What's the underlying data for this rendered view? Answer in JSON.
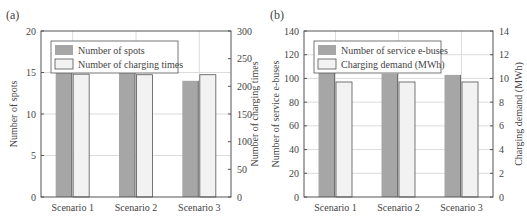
{
  "colors": {
    "bar_dark": "#a6a6a6",
    "bar_light": "#f2f2f2",
    "bar_stroke": "#555555",
    "grid": "#dcdcdc",
    "axis": "#555555"
  },
  "chart_data": [
    {
      "panel_label": "(a)",
      "type": "bar",
      "title": "",
      "categories": [
        "Scenario 1",
        "Scenario 2",
        "Scenario 3"
      ],
      "series": [
        {
          "name": "Number of spots",
          "axis": "left",
          "values": [
            15,
            15,
            14
          ]
        },
        {
          "name": "Number of charging times",
          "axis": "right",
          "values": [
            222,
            221,
            221
          ]
        }
      ],
      "xlabel": "",
      "ylabel": "Number of spots",
      "ylabel_right": "Number of charging times",
      "ylim": [
        0,
        20
      ],
      "ylim_right": [
        0,
        300
      ],
      "yticks": [
        0,
        5,
        10,
        15,
        20
      ],
      "yticks_right": [
        0,
        50,
        100,
        150,
        200,
        250,
        300
      ],
      "grid": true,
      "legend_position": "upper left"
    },
    {
      "panel_label": "(b)",
      "type": "bar",
      "title": "",
      "categories": [
        "Scenario 1",
        "Scenario 2",
        "Scenario 3"
      ],
      "series": [
        {
          "name": "Number of service e-buses",
          "axis": "left",
          "values": [
            106,
            104,
            103
          ]
        },
        {
          "name": "Charging demand (MWh)",
          "axis": "right",
          "values": [
            9.7,
            9.7,
            9.7
          ]
        }
      ],
      "xlabel": "",
      "ylabel": "Number of service e-buses",
      "ylabel_right": "Charging demand (MWh)",
      "ylim": [
        0,
        140
      ],
      "ylim_right": [
        0,
        14
      ],
      "yticks": [
        0,
        20,
        40,
        60,
        80,
        100,
        120,
        140
      ],
      "yticks_right": [
        0,
        2,
        4,
        6,
        8,
        10,
        12,
        14
      ],
      "grid": true,
      "legend_position": "upper left"
    }
  ]
}
